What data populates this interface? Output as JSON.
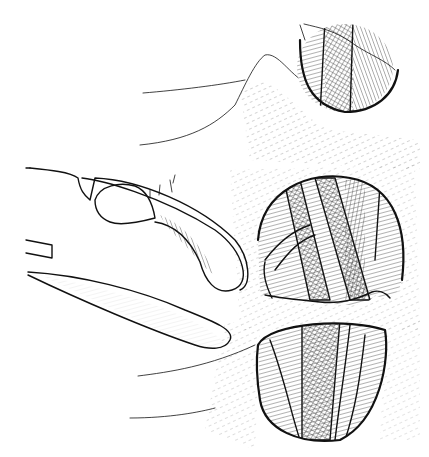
{
  "illustration": {
    "subject": "anatomical line drawing with retractor and three circular exposures of fibrous/muscle tissue",
    "colors": {
      "ink": "#111111",
      "paper": "#ffffff"
    },
    "regions": [
      {
        "name": "upper-exposure",
        "cx": 345,
        "cy": 70,
        "rx": 50,
        "ry": 45
      },
      {
        "name": "middle-exposure",
        "cx": 330,
        "cy": 255,
        "rx": 72,
        "ry": 68
      },
      {
        "name": "lower-exposure",
        "cx": 315,
        "cy": 375,
        "rx": 68,
        "ry": 65
      },
      {
        "name": "retractor-spoon",
        "x": 70,
        "y": 180
      }
    ]
  }
}
